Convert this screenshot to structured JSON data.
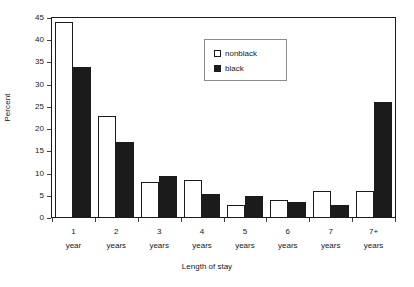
{
  "chart_data": {
    "type": "bar",
    "title": "",
    "subtitle": "",
    "xlabel": "Length of stay",
    "ylabel": "Percent",
    "categories": [
      "1 year",
      "2 years",
      "3 years",
      "4 years",
      "5 years",
      "6 years",
      "7 years",
      "7+ years"
    ],
    "category_lines": [
      {
        "line1": "1",
        "line2": "year"
      },
      {
        "line1": "2",
        "line2": "years"
      },
      {
        "line1": "3",
        "line2": "years"
      },
      {
        "line1": "4",
        "line2": "years"
      },
      {
        "line1": "5",
        "line2": "years"
      },
      {
        "line1": "6",
        "line2": "years"
      },
      {
        "line1": "7",
        "line2": "years"
      },
      {
        "line1": "7+",
        "line2": "years"
      }
    ],
    "series": [
      {
        "name": "nonblack",
        "fill": "#ffffff",
        "values": [
          44,
          23,
          8,
          8.5,
          3,
          4,
          6,
          6
        ]
      },
      {
        "name": "black",
        "fill": "#1b1b1b",
        "values": [
          34,
          17,
          9.5,
          5.5,
          5,
          3.5,
          3,
          26
        ]
      }
    ],
    "ylim": [
      0,
      45
    ],
    "yticks": [
      0,
      5,
      10,
      15,
      20,
      25,
      30,
      35,
      40,
      45
    ],
    "ytick_labels": [
      "0",
      "5",
      "10",
      "15",
      "20",
      "25",
      "30",
      "35",
      "40",
      "45"
    ],
    "grid": false,
    "legend_position": "upper-center",
    "legend_entries": [
      "nonblack",
      "black"
    ],
    "axis_color": "#1b1b1b"
  }
}
